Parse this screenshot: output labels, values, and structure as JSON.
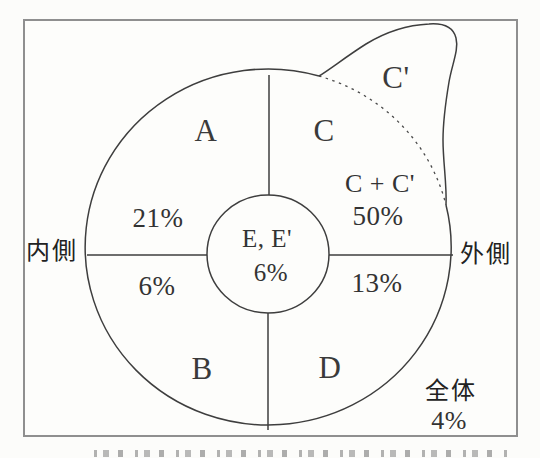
{
  "figure": {
    "side_labels": {
      "inner": "内側",
      "outer": "外側"
    },
    "regions": [
      {
        "id": "A",
        "label": "A",
        "value": "21%"
      },
      {
        "id": "B",
        "label": "B",
        "value": "6%"
      },
      {
        "id": "C",
        "label": "C",
        "value": ""
      },
      {
        "id": "C-prime",
        "label": "C'",
        "value": ""
      },
      {
        "id": "C+C'",
        "label": "C + C'",
        "value": "50%"
      },
      {
        "id": "D",
        "label": "D",
        "value": "13%"
      },
      {
        "id": "E",
        "label": "E, E'",
        "value": "6%"
      },
      {
        "id": "total",
        "label": "全体",
        "value": "4%"
      }
    ],
    "colors": {
      "line": "#3e3e3e",
      "frame": "#8f8f8f",
      "text": "#333333",
      "background": "#fcfcfa"
    }
  }
}
